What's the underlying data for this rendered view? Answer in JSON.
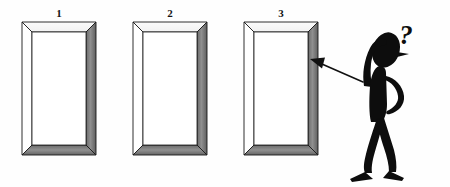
{
  "canvas": {
    "width": 450,
    "height": 187,
    "background_color": "#fefefe"
  },
  "illustration": {
    "title": "Three picture frames with puzzled stick figure",
    "ink_color": "#121212",
    "shade_color": "#8d8d8d",
    "shade_color_dark": "#6f6f6f",
    "frame_face_color": "#ffffff"
  },
  "frames": [
    {
      "label": "1",
      "label_x": 59,
      "label_y": 17,
      "x": 22,
      "y": 22,
      "width": 74,
      "height": 133,
      "bevel": 10
    },
    {
      "label": "2",
      "label_x": 170,
      "label_y": 17,
      "x": 133,
      "y": 22,
      "width": 74,
      "height": 133,
      "bevel": 10
    },
    {
      "label": "3",
      "label_x": 281,
      "label_y": 17,
      "x": 244,
      "y": 22,
      "width": 74,
      "height": 133,
      "bevel": 10
    }
  ],
  "figure": {
    "name": "stick-figure",
    "question_mark": "?",
    "question_mark_x": 406,
    "question_mark_y": 40,
    "pose": "head-scratching-pointing"
  },
  "arrow": {
    "name": "pointing-arrow",
    "from_x": 362,
    "from_y": 81,
    "to_x": 310,
    "to_y": 60,
    "target_label": "3"
  }
}
